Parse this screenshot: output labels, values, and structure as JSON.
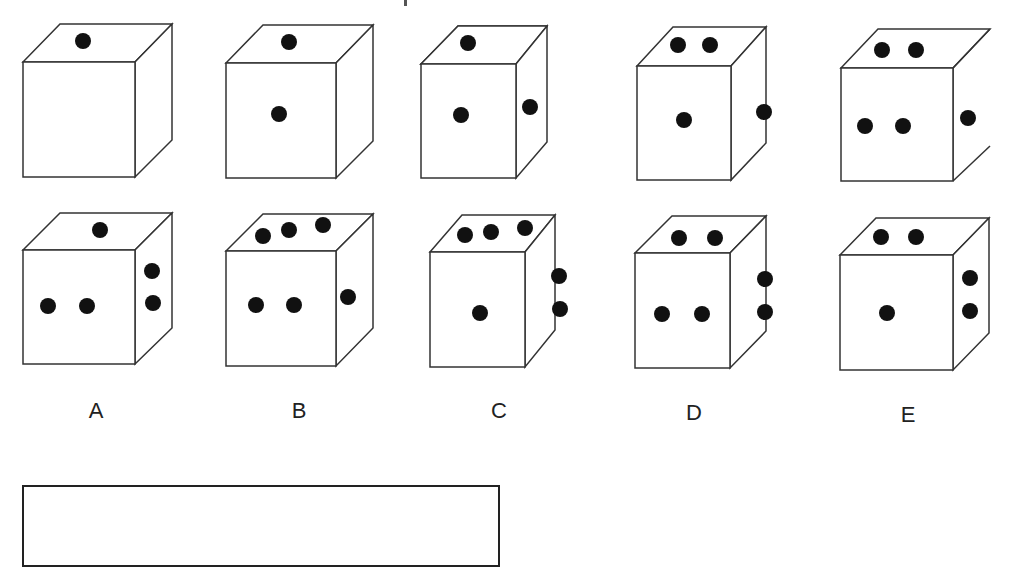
{
  "puzzle": {
    "sequence_row": [
      {
        "top_dots": 1,
        "front_dots": 0,
        "side_dots": 0
      },
      {
        "top_dots": 1,
        "front_dots": 1,
        "side_dots": 0
      },
      {
        "top_dots": 1,
        "front_dots": 1,
        "side_dots": 1
      },
      {
        "top_dots": 2,
        "front_dots": 1,
        "side_dots": 1
      },
      {
        "top_dots": 2,
        "front_dots": 2,
        "side_dots": 1
      }
    ],
    "options": [
      {
        "label": "A",
        "top_dots": 1,
        "front_dots": 2,
        "side_dots": 2
      },
      {
        "label": "B",
        "top_dots": 3,
        "front_dots": 2,
        "side_dots": 1
      },
      {
        "label": "C",
        "top_dots": 3,
        "front_dots": 1,
        "side_dots": 2
      },
      {
        "label": "D",
        "top_dots": 2,
        "front_dots": 2,
        "side_dots": 2
      },
      {
        "label": "E",
        "top_dots": 2,
        "front_dots": 1,
        "side_dots": 2
      }
    ],
    "answer_box": ""
  },
  "colors": {
    "line": "#333333",
    "dot": "#111111",
    "background": "#ffffff"
  }
}
